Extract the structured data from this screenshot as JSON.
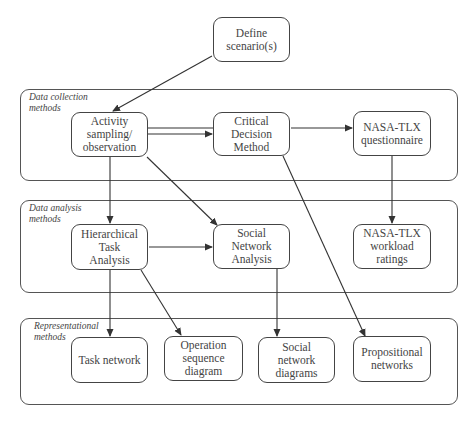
{
  "groups": {
    "collection": {
      "label": "Data collection\nmethods"
    },
    "analysis": {
      "label": "Data analysis\nmethods"
    },
    "representational": {
      "label": "Representational\nmethods"
    }
  },
  "nodes": {
    "define": "Define\nscenario(s)",
    "activity": "Activity\nsampling/\nobservation",
    "cdm": "Critical\nDecision\nMethod",
    "nasa_q": "NASA-TLX\nquestionnaire",
    "hta": "Hierarchical\nTask\nAnalysis",
    "sna": "Social\nNetwork\nAnalysis",
    "nasa_r": "NASA-TLX\nworkload\nratings",
    "task_network": "Task network",
    "osd": "Operation\nsequence\ndiagram",
    "sn_diagrams": "Social\nnetwork\ndiagrams",
    "prop": "Propositional\nnetworks"
  },
  "edges": [
    {
      "from": "Define scenario(s)",
      "to": "Activity sampling/observation"
    },
    {
      "from": "Activity sampling/observation",
      "to": "Critical Decision Method"
    },
    {
      "from": "Critical Decision Method",
      "to": "NASA-TLX questionnaire"
    },
    {
      "from": "Activity sampling/observation",
      "to": "Hierarchical Task Analysis"
    },
    {
      "from": "Activity sampling/observation",
      "to": "Social Network Analysis"
    },
    {
      "from": "Critical Decision Method",
      "to": "Propositional networks"
    },
    {
      "from": "NASA-TLX questionnaire",
      "to": "NASA-TLX workload ratings"
    },
    {
      "from": "Hierarchical Task Analysis",
      "to": "Social Network Analysis"
    },
    {
      "from": "Hierarchical Task Analysis",
      "to": "Task network"
    },
    {
      "from": "Hierarchical Task Analysis",
      "to": "Operation sequence diagram"
    },
    {
      "from": "Social Network Analysis",
      "to": "Social network diagrams"
    }
  ]
}
